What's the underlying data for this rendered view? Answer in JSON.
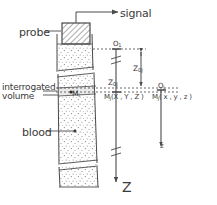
{
  "figure": {
    "kind": "doppler-ultrasound-blood-vessel-schematic",
    "labels": {
      "probe": "probe",
      "signal": "signal",
      "interrogated_line1": "interrogated",
      "interrogated_line2": "volume",
      "blood": "blood",
      "axis_Z": "Z",
      "axis_z": "z",
      "origin_upper": "O",
      "origin_upper_sub": "1",
      "origin_lower": "O",
      "origin_lower_sub": "j",
      "distance_left": "Z",
      "distance_left_sub": "0j",
      "distance_mid": "Z",
      "distance_mid_sub": "0j",
      "point_Mi": "M",
      "point_Mi_sub": "i",
      "point_global": "M",
      "point_global_sub": "j",
      "point_global_coords": "(X , Y , Z )",
      "point_global_coords_subs": "j j j",
      "point_local": "M",
      "point_local_sub": "j",
      "point_local_coords": "( x , y , z )",
      "point_local_coords_subs": "j j j"
    },
    "colors": {
      "line": "#4a4a4a",
      "text": "#3a3a3a",
      "stipple": "#6d6d6d",
      "background": "#ffffff"
    }
  }
}
